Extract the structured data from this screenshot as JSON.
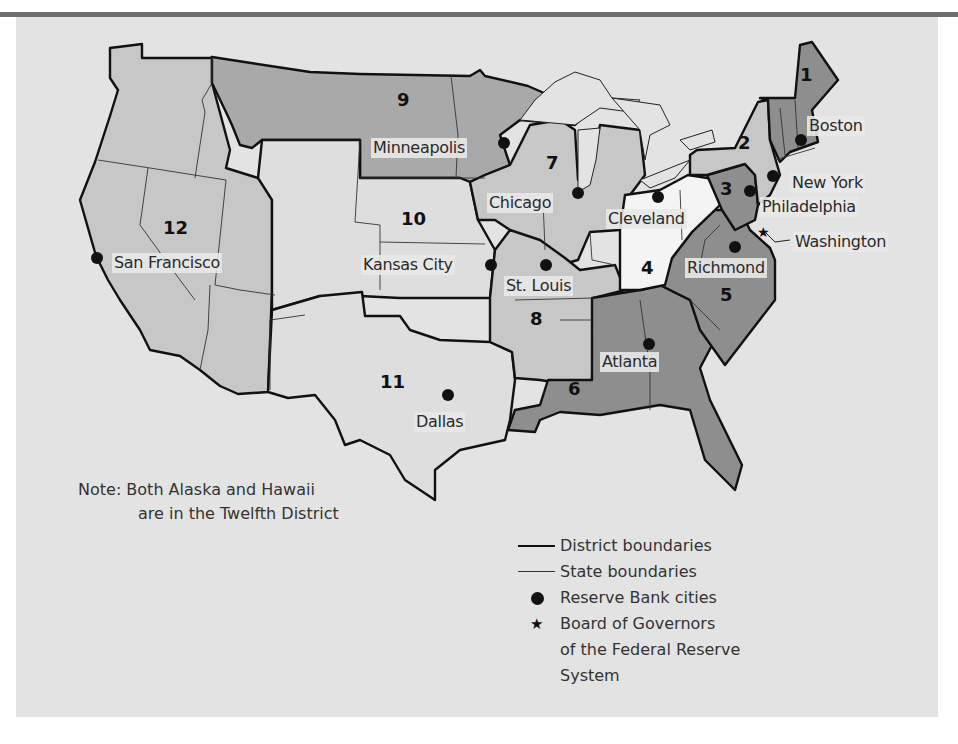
{
  "map": {
    "title": "Federal Reserve Districts",
    "colors": {
      "background": "#e3e3e3",
      "rule": "#6e6e6e",
      "light": "#c7c7c7",
      "lighter": "#dedede",
      "white": "#f4f4f4",
      "medium": "#a9a9a9",
      "dark": "#8e8e8e",
      "boundary": "#111111"
    },
    "districts": [
      {
        "number": "1",
        "city": "Boston"
      },
      {
        "number": "2",
        "city": "New York"
      },
      {
        "number": "3",
        "city": "Philadelphia"
      },
      {
        "number": "4",
        "city": "Cleveland"
      },
      {
        "number": "5",
        "city": "Richmond"
      },
      {
        "number": "6",
        "city": "Atlanta"
      },
      {
        "number": "7",
        "city": "Chicago"
      },
      {
        "number": "8",
        "city": "St. Louis"
      },
      {
        "number": "9",
        "city": "Minneapolis"
      },
      {
        "number": "10",
        "city": "Kansas City"
      },
      {
        "number": "11",
        "city": "Dallas"
      },
      {
        "number": "12",
        "city": "San Francisco"
      }
    ],
    "board_location": "Washington"
  },
  "note": {
    "line1": "Note: Both Alaska and Hawaii",
    "line2": "are in the Twelfth District"
  },
  "legend": {
    "items": [
      {
        "symbol": "thick-line",
        "label": "District boundaries"
      },
      {
        "symbol": "thin-line",
        "label": "State boundaries"
      },
      {
        "symbol": "dot",
        "label": "Reserve Bank cities"
      },
      {
        "symbol": "star",
        "label": "Board of Governors of the Federal Reserve System"
      }
    ],
    "star_glyph": "★",
    "board_line1": "Board of Governors",
    "board_line2": "of the Federal Reserve",
    "board_line3": "System"
  }
}
